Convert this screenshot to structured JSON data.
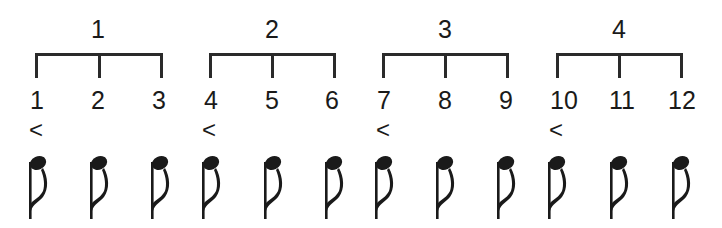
{
  "diagram": {
    "groups": [
      {
        "label": "1",
        "beats": [
          "1",
          "2",
          "3"
        ]
      },
      {
        "label": "2",
        "beats": [
          "4",
          "5",
          "6"
        ]
      },
      {
        "label": "3",
        "beats": [
          "7",
          "8",
          "9"
        ]
      },
      {
        "label": "4",
        "beats": [
          "10",
          "11",
          "12"
        ]
      }
    ],
    "accent_symbol": "<",
    "accented_beats": [
      "1",
      "4",
      "7",
      "10"
    ],
    "note_type": "eighth-note",
    "note_count": 12,
    "colors": {
      "ink": "#1a1a1a",
      "background": "#ffffff"
    }
  }
}
